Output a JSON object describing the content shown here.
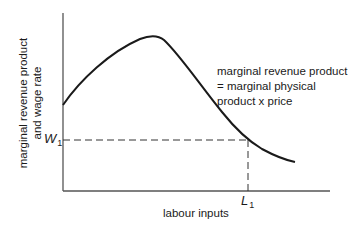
{
  "diagram": {
    "y_axis_label": {
      "line1": "marginal revenue product",
      "line2": "and wage rate"
    },
    "x_axis_label": "labour inputs",
    "curve_label": {
      "line1": "marginal revenue product",
      "line2": "= marginal physical",
      "line3": "product x price"
    },
    "markers": {
      "w": {
        "letter": "W",
        "sub": "1"
      },
      "l": {
        "letter": "L",
        "sub": "1"
      }
    },
    "colors": {
      "line": "#1a1a1a",
      "axis": "#555555",
      "background": "#ffffff"
    }
  }
}
